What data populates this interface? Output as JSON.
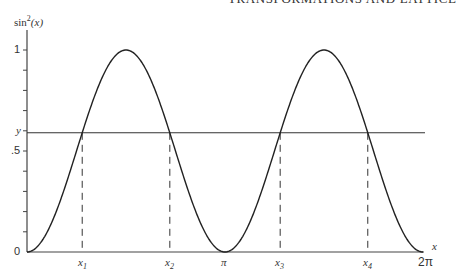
{
  "page": {
    "running_header": "TRANSFORMATIONS AND LATTICE"
  },
  "chart_data": {
    "type": "line",
    "title": "",
    "ylabel": "sin²(x)",
    "xlabel": "x",
    "function": "sin^2(x)",
    "xlim": [
      0,
      6.2832
    ],
    "ylim": [
      0,
      1
    ],
    "y_ticks": [
      {
        "value": 0,
        "label": "0"
      },
      {
        "value": 0.5,
        "label": ".5"
      },
      {
        "value": 1,
        "label": "1"
      }
    ],
    "y_minor_tick_step": 0.1,
    "horizontal_line": {
      "label": "y",
      "value": 0.59
    },
    "x_ticks": [
      {
        "value": 0.876,
        "label": "x1"
      },
      {
        "value": 2.266,
        "label": "x2"
      },
      {
        "value": 3.1416,
        "label": "π"
      },
      {
        "value": 4.017,
        "label": "x3"
      },
      {
        "value": 5.407,
        "label": "x4"
      },
      {
        "value": 6.2832,
        "label": "2π"
      }
    ],
    "x": [
      0,
      0.785,
      1.571,
      2.356,
      3.142,
      3.927,
      4.712,
      5.498,
      6.283
    ],
    "values": [
      0,
      0.5,
      1,
      0.5,
      0,
      0.5,
      1,
      0.5,
      0
    ],
    "dashed_verticals": [
      "x1",
      "x2",
      "x3",
      "x4"
    ],
    "grid": false,
    "legend": null
  },
  "labels": {
    "y_axis_title_base": "sin",
    "y_axis_title_sup": "2",
    "y_axis_title_arg": "(x)",
    "y_tick_1": "1",
    "y_tick_half": ".5",
    "y_tick_0": "0",
    "y_line": "y",
    "x_axis_var": "x",
    "x1_base": "x",
    "x1_sub": "1",
    "x2_base": "x",
    "x2_sub": "2",
    "x3_base": "x",
    "x3_sub": "3",
    "x4_base": "x",
    "x4_sub": "4",
    "pi": "π",
    "two_pi": "2π"
  },
  "colors": {
    "line": "#222222",
    "axis": "#444444"
  }
}
